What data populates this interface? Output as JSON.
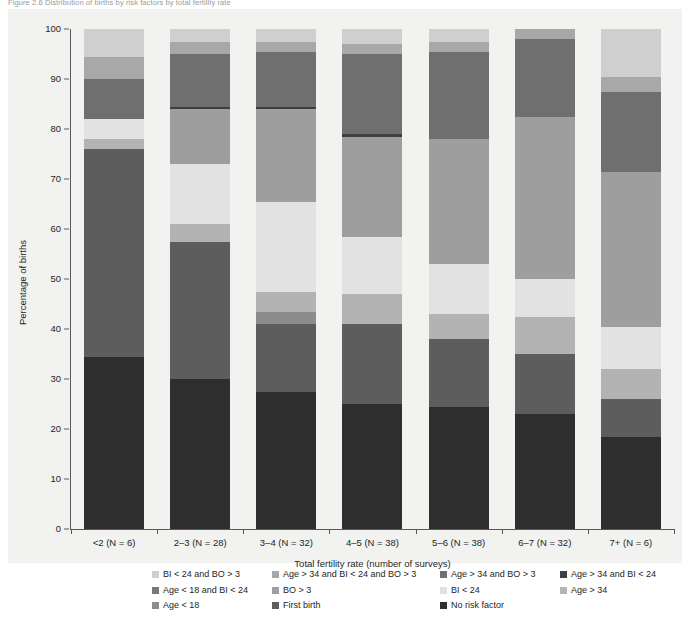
{
  "figure": {
    "caption": "Figure 2.6   Distribution of births by risk factors by total fertility rate"
  },
  "chart_data": {
    "type": "bar",
    "subtype": "stacked-bar-100-percent",
    "title": "",
    "xlabel": "Total fertility rate (number of surveys)",
    "ylabel": "Percentage of births",
    "ylim": [
      0,
      100
    ],
    "yticks": [
      0,
      10,
      20,
      30,
      40,
      50,
      60,
      70,
      80,
      90,
      100
    ],
    "grid": false,
    "legend_position": "bottom",
    "categories": [
      "<2 (N = 6)",
      "2–3 (N = 28)",
      "3–4 (N = 32)",
      "4–5 (N = 38)",
      "5–6 (N = 38)",
      "6–7 (N = 32)",
      "7+ (N = 6)"
    ],
    "stack_order_bottom_to_top": [
      "No risk factor",
      "First birth",
      "Age < 18",
      "Age > 34",
      "BI < 24",
      "BO > 3",
      "Age < 18 and BI < 24",
      "Age > 34 and BI < 24",
      "Age > 34 and BO > 3",
      "Age > 34 and BI < 24 and BO > 3",
      "BI < 24 and BO > 3"
    ],
    "series": [
      {
        "name": "No risk factor",
        "color": "#2e2e2e",
        "values": [
          34.5,
          30.0,
          27.5,
          25.0,
          24.5,
          23.0,
          18.5
        ]
      },
      {
        "name": "First birth",
        "color": "#5d5d5d",
        "values": [
          41.5,
          27.5,
          13.5,
          16.0,
          13.5,
          12.0,
          7.5
        ]
      },
      {
        "name": "Age < 18",
        "color": "#8c8c8c",
        "values": [
          0.0,
          0.0,
          2.5,
          0.0,
          0.0,
          0.0,
          0.0
        ]
      },
      {
        "name": "Age > 34",
        "color": "#b3b3b3",
        "values": [
          2.0,
          3.5,
          4.0,
          6.0,
          5.0,
          7.5,
          6.0
        ]
      },
      {
        "name": "BI < 24",
        "color": "#e2e2e2",
        "values": [
          4.0,
          12.0,
          18.0,
          11.5,
          10.0,
          7.5,
          8.5
        ]
      },
      {
        "name": "BO > 3",
        "color": "#9e9e9e",
        "values": [
          0.0,
          11.0,
          18.5,
          20.0,
          25.0,
          32.5,
          31.0
        ]
      },
      {
        "name": "Age < 18 and BI < 24",
        "color": "#7a7a7a",
        "values": [
          0.0,
          0.0,
          0.0,
          0.0,
          0.0,
          0.0,
          0.0
        ]
      },
      {
        "name": "Age > 34 and BI < 24",
        "color": "#3f3f3f",
        "values": [
          0.0,
          0.5,
          0.5,
          0.5,
          0.0,
          0.0,
          0.0
        ]
      },
      {
        "name": "Age > 34 and BO > 3",
        "color": "#6f6f6f",
        "values": [
          8.0,
          10.5,
          11.0,
          16.0,
          17.5,
          15.5,
          16.0
        ]
      },
      {
        "name": "Age > 34 and BI < 24 and BO > 3",
        "color": "#a8a8a8",
        "values": [
          4.5,
          2.5,
          2.0,
          2.0,
          2.0,
          2.0,
          3.0
        ]
      },
      {
        "name": "BI < 24 and BO > 3",
        "color": "#cfcfcf",
        "values": [
          5.5,
          2.5,
          2.5,
          3.0,
          2.5,
          0.0,
          9.5
        ]
      }
    ]
  },
  "legend": {
    "rows": [
      [
        {
          "label": "BI < 24 and BO > 3",
          "color": "#cfcfcf"
        },
        {
          "label": "Age > 34 and BI < 24 and BO > 3",
          "color": "#a8a8a8"
        },
        {
          "label": "Age > 34 and BO > 3",
          "color": "#6f6f6f"
        },
        {
          "label": "Age > 34 and BI < 24",
          "color": "#3f3f3f"
        }
      ],
      [
        {
          "label": "Age < 18 and BI < 24",
          "color": "#7a7a7a"
        },
        {
          "label": "BO > 3",
          "color": "#9e9e9e"
        },
        {
          "label": "BI < 24",
          "color": "#e2e2e2"
        },
        {
          "label": "Age > 34",
          "color": "#b3b3b3"
        }
      ],
      [
        {
          "label": "Age < 18",
          "color": "#8c8c8c"
        },
        {
          "label": "First birth",
          "color": "#5d5d5d"
        },
        {
          "label": "No risk factor",
          "color": "#2e2e2e"
        }
      ]
    ]
  },
  "style": {
    "panel_background": "#f2f2f0",
    "axis_color": "#58595b",
    "text_color": "#231f20"
  }
}
